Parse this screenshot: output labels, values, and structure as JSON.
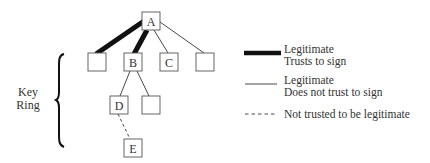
{
  "diagram": {
    "type": "tree",
    "nodes": [
      {
        "id": "A",
        "label": "A",
        "x": 142,
        "y": 12
      },
      {
        "id": "n1",
        "label": "",
        "x": 88,
        "y": 53
      },
      {
        "id": "B",
        "label": "B",
        "x": 124,
        "y": 53
      },
      {
        "id": "C",
        "label": "C",
        "x": 160,
        "y": 53
      },
      {
        "id": "n4",
        "label": "",
        "x": 196,
        "y": 53
      },
      {
        "id": "D",
        "label": "D",
        "x": 110,
        "y": 96
      },
      {
        "id": "n6",
        "label": "",
        "x": 142,
        "y": 96
      },
      {
        "id": "E",
        "label": "E",
        "x": 124,
        "y": 139
      }
    ],
    "edges": [
      {
        "from": "A",
        "to": "n1",
        "style": "thick"
      },
      {
        "from": "A",
        "to": "B",
        "style": "thick"
      },
      {
        "from": "A",
        "to": "C",
        "style": "thin"
      },
      {
        "from": "A",
        "to": "n4",
        "style": "thin"
      },
      {
        "from": "B",
        "to": "D",
        "style": "thin"
      },
      {
        "from": "B",
        "to": "n6",
        "style": "thin"
      },
      {
        "from": "D",
        "to": "E",
        "style": "dashed"
      }
    ],
    "bracket_label_line1": "Key",
    "bracket_label_line2": "Ring"
  },
  "legend": {
    "items": [
      {
        "style": "thick",
        "line1": "Legitimate",
        "line2": "Trusts to sign"
      },
      {
        "style": "thin",
        "line1": "Legitimate",
        "line2": "Does not trust to sign"
      },
      {
        "style": "dashed",
        "line1": "Not trusted to be legitimate",
        "line2": ""
      }
    ]
  },
  "colors": {
    "line": "#1a1a1a",
    "box_stroke": "#555555",
    "text": "#333333",
    "background": "#ffffff"
  }
}
